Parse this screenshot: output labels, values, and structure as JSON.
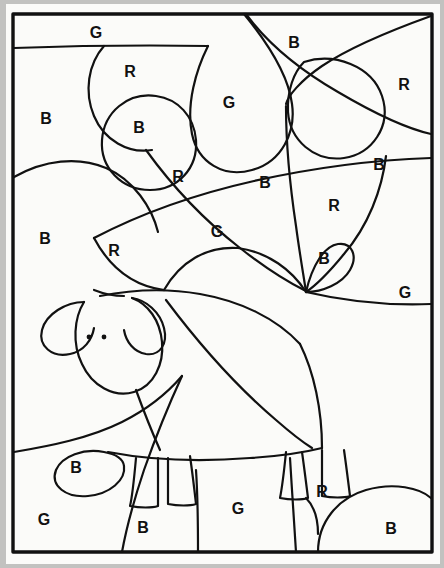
{
  "page": {
    "type": "color-by-letter-coloring-page",
    "background_color": "#c2c2c0",
    "paper_color": "#fbfbf9",
    "ink_color": "#111111",
    "frame": {
      "x": 12,
      "y": 13,
      "width": 420,
      "height": 539
    }
  },
  "legend": {
    "codes": [
      {
        "letter": "B",
        "meaning": "Blue"
      },
      {
        "letter": "R",
        "meaning": "Red"
      },
      {
        "letter": "G",
        "meaning": "Green"
      }
    ]
  },
  "labels": [
    {
      "id": "lbl-01",
      "letter": "G",
      "x": 96,
      "y": 33
    },
    {
      "id": "lbl-02",
      "letter": "B",
      "x": 294,
      "y": 43
    },
    {
      "id": "lbl-03",
      "letter": "R",
      "x": 130,
      "y": 72
    },
    {
      "id": "lbl-04",
      "letter": "R",
      "x": 404,
      "y": 85
    },
    {
      "id": "lbl-05",
      "letter": "G",
      "x": 229,
      "y": 103
    },
    {
      "id": "lbl-06",
      "letter": "B",
      "x": 46,
      "y": 119
    },
    {
      "id": "lbl-07",
      "letter": "B",
      "x": 139,
      "y": 128
    },
    {
      "id": "lbl-08",
      "letter": "B",
      "x": 379,
      "y": 165
    },
    {
      "id": "lbl-09",
      "letter": "R",
      "x": 178,
      "y": 177
    },
    {
      "id": "lbl-10",
      "letter": "B",
      "x": 265,
      "y": 183
    },
    {
      "id": "lbl-11",
      "letter": "R",
      "x": 334,
      "y": 206
    },
    {
      "id": "lbl-12",
      "letter": "B",
      "x": 45,
      "y": 239
    },
    {
      "id": "lbl-13",
      "letter": "G",
      "x": 217,
      "y": 232
    },
    {
      "id": "lbl-14",
      "letter": "R",
      "x": 114,
      "y": 251
    },
    {
      "id": "lbl-15",
      "letter": "B",
      "x": 324,
      "y": 259
    },
    {
      "id": "lbl-16",
      "letter": "G",
      "x": 405,
      "y": 293
    },
    {
      "id": "lbl-17",
      "letter": "B",
      "x": 76,
      "y": 468
    },
    {
      "id": "lbl-18",
      "letter": "G",
      "x": 44,
      "y": 520
    },
    {
      "id": "lbl-19",
      "letter": "B",
      "x": 143,
      "y": 528
    },
    {
      "id": "lbl-20",
      "letter": "G",
      "x": 238,
      "y": 509
    },
    {
      "id": "lbl-21",
      "letter": "R",
      "x": 322,
      "y": 492
    },
    {
      "id": "lbl-22",
      "letter": "B",
      "x": 391,
      "y": 529
    }
  ],
  "drawing": {
    "sheep": {
      "parts": [
        "head",
        "left-ear",
        "right-ear",
        "eye-left",
        "eye-right",
        "body",
        "foreleg-front",
        "foreleg-back",
        "hindleg-front",
        "hindleg-back",
        "tail"
      ]
    },
    "background_shapes": [
      "sky-band",
      "hill-left",
      "tree-circles",
      "foliage-arcs",
      "bush-right",
      "ground-line"
    ]
  }
}
